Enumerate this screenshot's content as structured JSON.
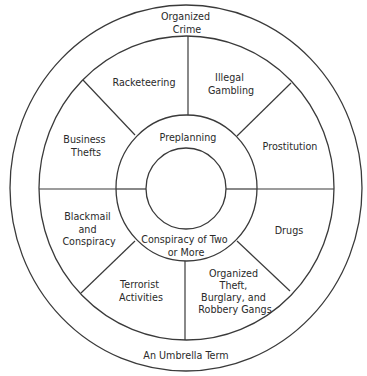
{
  "diagram": {
    "type": "concentric-wheel",
    "outer_ring": {
      "top_label": [
        "Organized",
        "Crime"
      ],
      "bottom_label": "An Umbrella Term"
    },
    "segments": [
      {
        "name": "racketeering",
        "lines": [
          "Racketeering"
        ]
      },
      {
        "name": "illegal-gambling",
        "lines": [
          "Illegal",
          "Gambling"
        ]
      },
      {
        "name": "prostitution",
        "lines": [
          "Prostitution"
        ]
      },
      {
        "name": "drugs",
        "lines": [
          "Drugs"
        ]
      },
      {
        "name": "organized-theft",
        "lines": [
          "Organized",
          "Theft,",
          "Burglary, and",
          "Robbery Gangs"
        ]
      },
      {
        "name": "terrorist-activities",
        "lines": [
          "Terrorist",
          "Activities"
        ]
      },
      {
        "name": "blackmail-conspiracy",
        "lines": [
          "Blackmail",
          "and",
          "Conspiracy"
        ]
      },
      {
        "name": "business-thefts",
        "lines": [
          "Business",
          "Thefts"
        ]
      }
    ],
    "inner_ring": {
      "top_label": "Preplanning",
      "bottom_label": [
        "Conspiracy of Two",
        "or More"
      ]
    },
    "colors": {
      "line": "#3a3a3a",
      "text": "#2a2a2a",
      "background": "#ffffff"
    }
  }
}
